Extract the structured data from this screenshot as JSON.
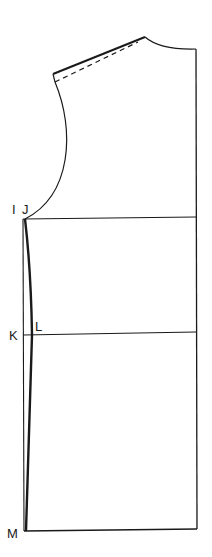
{
  "diagram": {
    "type": "bodice-pattern-draft",
    "colors": {
      "stroke": "#1a1a1a",
      "background": "#ffffff"
    },
    "labels": {
      "I": "I",
      "J": "J",
      "K": "K",
      "L": "L",
      "M": "M"
    }
  }
}
